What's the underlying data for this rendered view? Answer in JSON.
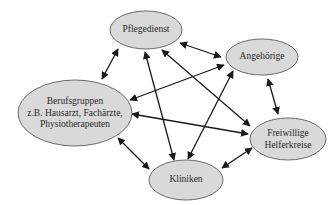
{
  "diagram": {
    "type": "network",
    "colors": {
      "node_fill": "#d9d9d9",
      "node_stroke": "#6a6a6a",
      "edge": "#1a1a1a",
      "text": "#2a2a2a"
    },
    "nodes": [
      {
        "id": "pflegedienst",
        "lines": [
          "Pflegedienst"
        ],
        "cx": 146,
        "cy": 30,
        "rx": 36,
        "ry": 19
      },
      {
        "id": "angehoerige",
        "lines": [
          "Angehörige"
        ],
        "cx": 262,
        "cy": 57,
        "rx": 36,
        "ry": 18
      },
      {
        "id": "berufsgruppen",
        "lines": [
          "Berufsgruppen",
          "z.B. Hausarzt, Fachärzte,",
          "Physiotherapeuten"
        ],
        "cx": 75,
        "cy": 113,
        "rx": 57,
        "ry": 33
      },
      {
        "id": "freiwillige",
        "lines": [
          "Freiwillige",
          "Helferkreise"
        ],
        "cx": 288,
        "cy": 139,
        "rx": 38,
        "ry": 21
      },
      {
        "id": "kliniken",
        "lines": [
          "Kliniken"
        ],
        "cx": 186,
        "cy": 180,
        "rx": 37,
        "ry": 20
      }
    ],
    "edges": [
      {
        "from": "pflegedienst",
        "to": "angehoerige",
        "x1": 180,
        "y1": 43,
        "x2": 221,
        "y2": 57
      },
      {
        "from": "pflegedienst",
        "to": "berufsgruppen",
        "x1": 118,
        "y1": 49,
        "x2": 102,
        "y2": 79
      },
      {
        "from": "pflegedienst",
        "to": "kliniken",
        "x1": 145,
        "y1": 52,
        "x2": 174,
        "y2": 160
      },
      {
        "from": "pflegedienst",
        "to": "freiwillige",
        "x1": 162,
        "y1": 50,
        "x2": 250,
        "y2": 126
      },
      {
        "from": "angehoerige",
        "to": "berufsgruppen",
        "x1": 224,
        "y1": 65,
        "x2": 130,
        "y2": 100
      },
      {
        "from": "angehoerige",
        "to": "kliniken",
        "x1": 233,
        "y1": 71,
        "x2": 188,
        "y2": 159
      },
      {
        "from": "angehoerige",
        "to": "freiwillige",
        "x1": 268,
        "y1": 79,
        "x2": 278,
        "y2": 114
      },
      {
        "from": "berufsgruppen",
        "to": "freiwillige",
        "x1": 132,
        "y1": 114,
        "x2": 248,
        "y2": 134
      },
      {
        "from": "berufsgruppen",
        "to": "kliniken",
        "x1": 118,
        "y1": 138,
        "x2": 149,
        "y2": 169
      },
      {
        "from": "kliniken",
        "to": "freiwillige",
        "x1": 222,
        "y1": 168,
        "x2": 252,
        "y2": 148
      }
    ]
  }
}
